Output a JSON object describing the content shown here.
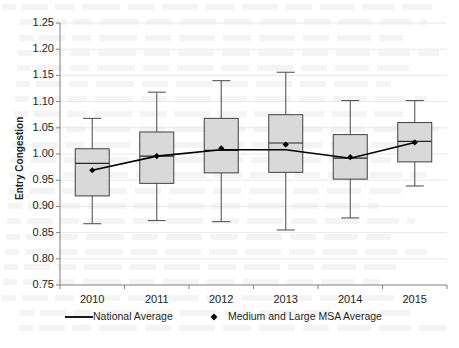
{
  "chart_data": {
    "type": "box",
    "title": "",
    "xlabel": "",
    "ylabel": "Entry Congestion",
    "categories": [
      "2010",
      "2011",
      "2012",
      "2013",
      "2014",
      "2015"
    ],
    "ylim": [
      0.75,
      1.25
    ],
    "ytick_step": 0.05,
    "ytick_labels": [
      "1.25",
      "1.20",
      "1.15",
      "1.10",
      "1.05",
      "1.00",
      "0.95",
      "0.90",
      "0.85",
      "0.80",
      "0.75"
    ],
    "grid": "horizontal",
    "legend_position": "bottom",
    "box_fill_color": "#d9d9d9",
    "box_line_color": "#404040",
    "line_color": "#000000",
    "marker_color": "#000000",
    "series": [
      {
        "name": "Medium and Large MSA Average",
        "type": "box",
        "boxes": [
          {
            "category": "2010",
            "whisker_low": 0.867,
            "q1": 0.92,
            "median": 0.982,
            "q3": 1.01,
            "whisker_high": 1.068,
            "mean": 0.969
          },
          {
            "category": "2011",
            "whisker_low": 0.873,
            "q1": 0.944,
            "median": 0.996,
            "q3": 1.042,
            "whisker_high": 1.118,
            "mean": 0.996
          },
          {
            "category": "2012",
            "whisker_low": 0.871,
            "q1": 0.964,
            "median": 1.007,
            "q3": 1.068,
            "whisker_high": 1.14,
            "mean": 1.011
          },
          {
            "category": "2013",
            "whisker_low": 0.855,
            "q1": 0.965,
            "median": 1.021,
            "q3": 1.075,
            "whisker_high": 1.156,
            "mean": 1.018
          },
          {
            "category": "2014",
            "whisker_low": 0.878,
            "q1": 0.952,
            "median": 0.992,
            "q3": 1.037,
            "whisker_high": 1.102,
            "mean": 0.994
          },
          {
            "category": "2015",
            "whisker_low": 0.939,
            "q1": 0.985,
            "median": 1.024,
            "q3": 1.06,
            "whisker_high": 1.102,
            "mean": 1.022
          }
        ]
      },
      {
        "name": "National Average",
        "type": "line",
        "values": [
          0.969,
          0.996,
          1.008,
          1.008,
          0.992,
          1.022
        ]
      }
    ]
  },
  "legend": {
    "items": [
      {
        "label": "National Average",
        "marker": "line"
      },
      {
        "label": "Medium and Large MSA Average",
        "marker": "diamond"
      }
    ]
  }
}
